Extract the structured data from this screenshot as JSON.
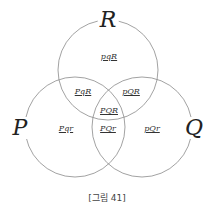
{
  "diagram": {
    "type": "venn",
    "sets": [
      {
        "label": "R",
        "cx": 108,
        "cy": 70,
        "r": 50
      },
      {
        "label": "P",
        "cx": 75,
        "cy": 127,
        "r": 50
      },
      {
        "label": "Q",
        "cx": 142,
        "cy": 127,
        "r": 50
      }
    ],
    "regions": {
      "pqR": "pqR",
      "PqR": "PqR",
      "pQR": "pQR",
      "PQR": "PQR",
      "Pqr": "Pqr",
      "PQr": "PQr",
      "pQr": "pQr"
    },
    "line_color": "#8a8a8a"
  },
  "caption": "[그림 41]"
}
